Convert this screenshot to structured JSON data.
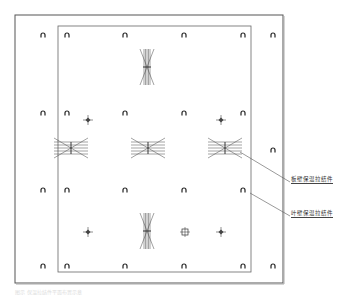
{
  "diagram": {
    "type": "floor-plan-layout",
    "outer_frame": {
      "x": 15,
      "y": 15,
      "w": 268,
      "h": 268
    },
    "inner_frame": {
      "x": 58,
      "y": 26,
      "w": 193,
      "h": 246
    },
    "anchors": [
      [
        43,
        35
      ],
      [
        67,
        35
      ],
      [
        125,
        35
      ],
      [
        184,
        35
      ],
      [
        243,
        35
      ],
      [
        273,
        35
      ],
      [
        43,
        113
      ],
      [
        67,
        113
      ],
      [
        125,
        113
      ],
      [
        184,
        113
      ],
      [
        243,
        113
      ],
      [
        273,
        150
      ],
      [
        43,
        190
      ],
      [
        67,
        190
      ],
      [
        125,
        190
      ],
      [
        184,
        190
      ],
      [
        243,
        190
      ],
      [
        43,
        266
      ],
      [
        67,
        266
      ],
      [
        125,
        266
      ],
      [
        184,
        266
      ],
      [
        243,
        266
      ],
      [
        273,
        266
      ]
    ],
    "bundles_vertical": [
      [
        147,
        67
      ],
      [
        147,
        231
      ]
    ],
    "bundles_horizontal": [
      [
        71,
        148
      ],
      [
        148,
        148
      ],
      [
        225,
        148
      ]
    ],
    "cross_markers": [
      [
        88,
        120
      ],
      [
        221,
        120
      ],
      [
        88,
        232
      ],
      [
        221,
        232
      ]
    ],
    "square_marker": [
      185,
      232
    ],
    "labels": [
      {
        "text": "板壁保温拉结件",
        "x": 291,
        "y": 176
      },
      {
        "text": "叶壁保温拉结件",
        "x": 291,
        "y": 210
      }
    ],
    "caption": "图示 保温拉结件平面布置示意"
  }
}
